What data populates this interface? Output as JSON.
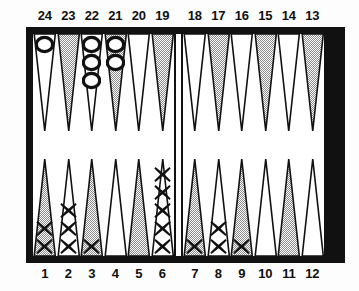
{
  "figure": {
    "name": "backgammon-board",
    "colors": {
      "frame": "#111111",
      "point_light": "#ffffff",
      "point_dark": "#a8a8a8",
      "checker_outline": "#111111",
      "label_text": "#101010",
      "background": "#ffffff"
    }
  },
  "labels": {
    "top": [
      "24",
      "23",
      "22",
      "21",
      "20",
      "19",
      "18",
      "17",
      "16",
      "15",
      "14",
      "13"
    ],
    "bottom": [
      "1",
      "2",
      "3",
      "4",
      "5",
      "6",
      "7",
      "8",
      "9",
      "10",
      "11",
      "12"
    ]
  },
  "points": {
    "top": [
      {
        "number": "24",
        "shade": "light",
        "checkers": 1,
        "piece": "O"
      },
      {
        "number": "23",
        "shade": "dark",
        "checkers": 0,
        "piece": null
      },
      {
        "number": "22",
        "shade": "light",
        "checkers": 3,
        "piece": "O"
      },
      {
        "number": "21",
        "shade": "dark",
        "checkers": 2,
        "piece": "O"
      },
      {
        "number": "20",
        "shade": "light",
        "checkers": 0,
        "piece": null
      },
      {
        "number": "19",
        "shade": "dark",
        "checkers": 0,
        "piece": null
      },
      {
        "number": "18",
        "shade": "light",
        "checkers": 0,
        "piece": null
      },
      {
        "number": "17",
        "shade": "dark",
        "checkers": 0,
        "piece": null
      },
      {
        "number": "16",
        "shade": "light",
        "checkers": 0,
        "piece": null
      },
      {
        "number": "15",
        "shade": "dark",
        "checkers": 0,
        "piece": null
      },
      {
        "number": "14",
        "shade": "light",
        "checkers": 0,
        "piece": null
      },
      {
        "number": "13",
        "shade": "dark",
        "checkers": 0,
        "piece": null
      }
    ],
    "bottom": [
      {
        "number": "1",
        "shade": "dark",
        "checkers": 2,
        "piece": "X"
      },
      {
        "number": "2",
        "shade": "light",
        "checkers": 3,
        "piece": "X"
      },
      {
        "number": "3",
        "shade": "dark",
        "checkers": 1,
        "piece": "X"
      },
      {
        "number": "4",
        "shade": "light",
        "checkers": 0,
        "piece": null
      },
      {
        "number": "5",
        "shade": "dark",
        "checkers": 0,
        "piece": null
      },
      {
        "number": "6",
        "shade": "light",
        "checkers": 5,
        "piece": "X"
      },
      {
        "number": "7",
        "shade": "dark",
        "checkers": 1,
        "piece": "X"
      },
      {
        "number": "8",
        "shade": "light",
        "checkers": 2,
        "piece": "X"
      },
      {
        "number": "9",
        "shade": "dark",
        "checkers": 1,
        "piece": "X"
      },
      {
        "number": "10",
        "shade": "light",
        "checkers": 0,
        "piece": null
      },
      {
        "number": "11",
        "shade": "dark",
        "checkers": 0,
        "piece": null
      },
      {
        "number": "12",
        "shade": "light",
        "checkers": 0,
        "piece": null
      }
    ]
  },
  "bar": {
    "O": 0,
    "X": 0
  }
}
